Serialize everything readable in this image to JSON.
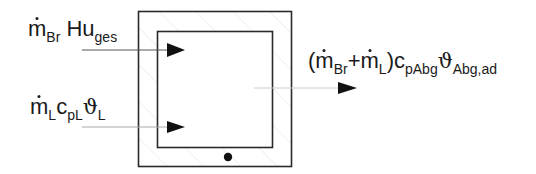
{
  "diagram": {
    "type": "energy-balance-control-volume",
    "inputs": [
      {
        "id": "fuel",
        "parts": [
          "m",
          "Br",
          "Hu",
          "ges"
        ],
        "text": "ṁBr Huges"
      },
      {
        "id": "air",
        "parts": [
          "m",
          "L",
          "c",
          "pL",
          "ϑ",
          "L"
        ],
        "text": "ṁL cpL ϑL"
      }
    ],
    "output": {
      "id": "exhaust",
      "text": "(ṁBr+ṁL) cpAbg ϑAbg,ad"
    },
    "labels": {
      "fuel": {
        "m": "m",
        "m_sub": "Br",
        "hu": "Hu",
        "hu_sub": "ges"
      },
      "air": {
        "m": "m",
        "m_sub": "L",
        "c": "c",
        "c_sub": "pL",
        "theta": "ϑ",
        "theta_sub": "L"
      },
      "exhaust": {
        "open": "(",
        "m1": "m",
        "m1_sub": "Br",
        "plus": "+",
        "m2": "m",
        "m2_sub": "L",
        "close": ")",
        "c": "c",
        "c_sub": "pAbg",
        "theta": "ϑ",
        "theta_sub": "Abg,ad"
      }
    },
    "colors": {
      "line": "#2a2a2a",
      "hatch": "#e6e6e6",
      "arrow": "#111111"
    }
  }
}
